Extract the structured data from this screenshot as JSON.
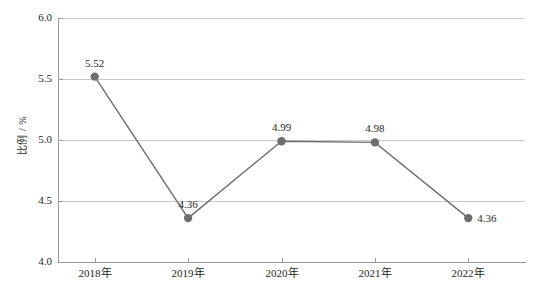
{
  "chart_data": {
    "type": "line",
    "title": "",
    "xlabel": "",
    "ylabel": "比例 / %",
    "categories": [
      "2018年",
      "2019年",
      "2020年",
      "2021年",
      "2022年"
    ],
    "values": [
      5.52,
      4.36,
      4.99,
      4.98,
      4.36
    ],
    "point_labels": [
      "5.52",
      "4.36",
      "4.99",
      "4.98",
      "4.36"
    ],
    "point_label_positions": [
      "above",
      "above",
      "above",
      "above",
      "right"
    ],
    "ylim": [
      4.0,
      6.0
    ],
    "ytick_values": [
      4.0,
      4.5,
      5.0,
      5.5,
      6.0
    ],
    "ytick_labels": [
      "4.0",
      "4.5",
      "5.0",
      "5.5",
      "6.0"
    ],
    "grid": "horizontal",
    "legend": "none",
    "series": [
      {
        "name": "比例",
        "values": [
          5.52,
          4.36,
          4.99,
          4.98,
          4.36
        ]
      }
    ],
    "colors": {
      "line": "#6e6e6e",
      "marker": "#6e6e6e",
      "grid": "#c9c9c9",
      "axis": "#9a9a9a",
      "text": "#231f20",
      "background": "#ffffff"
    }
  }
}
